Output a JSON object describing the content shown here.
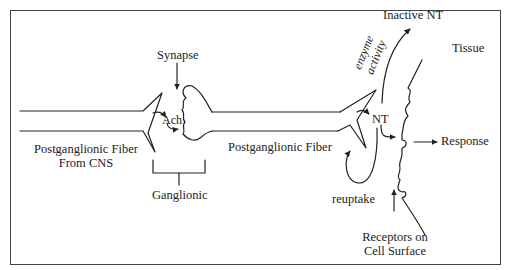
{
  "diagram": {
    "type": "autonomic-nervous-system-synapse",
    "labels": {
      "synapse": "Synapse",
      "ach": "Ach",
      "preganglionic_fiber_line1": "Postganglionic Fiber",
      "preganglionic_fiber_line2": "From CNS",
      "ganglionic": "Ganglionic",
      "postganglionic_fiber": "Postganglionic Fiber",
      "nt": "NT",
      "inactive_nt": "Inactive NT",
      "enzyme_line1": "enzyme",
      "enzyme_line2": "activity",
      "tissue": "Tissue",
      "response": "Response",
      "reuptake": "reuptake",
      "receptors_line1": "Receptors on",
      "receptors_line2": "Cell Surface"
    },
    "edges": [
      {
        "from": "synapse-label",
        "to": "ganglion-gap",
        "type": "arrow"
      },
      {
        "from": "pre-terminal",
        "to": "Ach",
        "type": "arrow"
      },
      {
        "from": "Ach",
        "to": "ganglion-cell",
        "type": "arrow"
      },
      {
        "from": "post-terminal",
        "to": "NT",
        "type": "arrow"
      },
      {
        "from": "NT",
        "to": "receptor",
        "type": "arrow"
      },
      {
        "from": "NT",
        "to": "Inactive NT",
        "label": "enzyme activity",
        "type": "arrow"
      },
      {
        "from": "NT",
        "to": "post-terminal",
        "label": "reuptake",
        "type": "arrow"
      },
      {
        "from": "receptor",
        "to": "Response",
        "type": "arrow"
      },
      {
        "from": "Receptors on Cell Surface",
        "to": "tissue-membrane",
        "type": "arrow"
      }
    ]
  }
}
